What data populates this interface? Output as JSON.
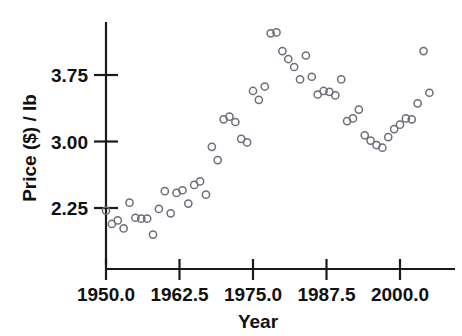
{
  "chart_data": {
    "type": "scatter",
    "title": "",
    "xlabel": "Year",
    "ylabel": "Price ($) / lb",
    "xlim": [
      1947.0,
      2006.5
    ],
    "ylim": [
      1.78,
      4.35
    ],
    "grid": false,
    "legend": null,
    "marker": "open-circle",
    "marker_color": "#6d6d78",
    "xticks": [
      1950.0,
      1962.5,
      1975.0,
      1987.5,
      2000.0
    ],
    "xticklabels": [
      "1950.0",
      "1962.5",
      "1975.0",
      "1987.5",
      "2000.0"
    ],
    "yticks": [
      2.25,
      3.0,
      3.75
    ],
    "yticklabels": [
      "2.25",
      "3.00",
      "3.75"
    ],
    "x": [
      1950,
      1951,
      1952,
      1953,
      1954,
      1955,
      1956,
      1957,
      1958,
      1959,
      1960,
      1961,
      1962,
      1963,
      1964,
      1965,
      1966,
      1967,
      1968,
      1969,
      1970,
      1971,
      1972,
      1973,
      1974,
      1975,
      1976,
      1977,
      1978,
      1979,
      1980,
      1981,
      1982,
      1983,
      1984,
      1985,
      1986,
      1987,
      1988,
      1989,
      1990,
      1991,
      1992,
      1993,
      1994,
      1995,
      1996,
      1997,
      1998,
      1999,
      2000,
      2001,
      2002,
      2003,
      2004,
      2005
    ],
    "y": [
      2.22,
      2.07,
      2.11,
      2.02,
      2.31,
      2.14,
      2.13,
      2.13,
      1.95,
      2.24,
      2.44,
      2.19,
      2.42,
      2.45,
      2.3,
      2.51,
      2.55,
      2.4,
      2.94,
      2.79,
      3.25,
      3.28,
      3.22,
      3.03,
      2.99,
      3.57,
      3.47,
      3.62,
      4.22,
      4.23,
      4.02,
      3.93,
      3.84,
      3.7,
      3.97,
      3.73,
      3.53,
      3.57,
      3.56,
      3.52,
      3.7,
      3.23,
      3.26,
      3.36,
      3.07,
      3.01,
      2.96,
      2.93,
      3.05,
      3.14,
      3.19,
      3.26,
      3.25,
      3.43,
      4.02,
      3.55
    ]
  }
}
